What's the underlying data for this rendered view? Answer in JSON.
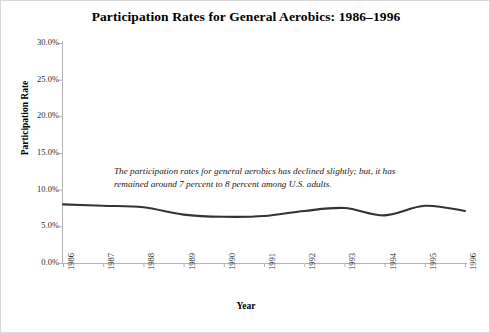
{
  "chart_data": {
    "type": "line",
    "title": "Participation Rates for General Aerobics: 1986–1996",
    "xlabel": "Year",
    "ylabel": "Participation Rate",
    "categories": [
      "1986",
      "1987",
      "1988",
      "1989",
      "1990",
      "1991",
      "1992",
      "1993",
      "1994",
      "1995",
      "1996"
    ],
    "x": [
      1986,
      1987,
      1988,
      1989,
      1990,
      1991,
      1992,
      1993,
      1994,
      1995,
      1996
    ],
    "values": [
      8.0,
      7.8,
      7.6,
      6.6,
      6.3,
      6.4,
      7.1,
      7.5,
      6.5,
      7.8,
      7.1
    ],
    "series": [
      {
        "name": "General Aerobics",
        "values": [
          8.0,
          7.8,
          7.6,
          6.6,
          6.3,
          6.4,
          7.1,
          7.5,
          6.5,
          7.8,
          7.1
        ]
      }
    ],
    "ylim": [
      0,
      30
    ],
    "ytick_values": [
      0.0,
      5.0,
      10.0,
      15.0,
      20.0,
      25.0,
      30.0
    ],
    "ytick_labels": [
      "0.0%",
      "5.0%",
      "10.0%",
      "15.0%",
      "20.0%",
      "25.0%",
      "30.0%"
    ],
    "xtick_labels": [
      "1986",
      "1987",
      "1988",
      "1989",
      "1990",
      "1991",
      "1992",
      "1993",
      "1994",
      "1995",
      "1996"
    ],
    "grid": false,
    "legend": "none",
    "line_color": "#333333",
    "annotations": [
      {
        "text": "The participation rates for general aerobics has declined slightly; but, it has remained around 7 percent to 8 percent among U.S. adults.",
        "style": "italic"
      }
    ]
  },
  "colors": {
    "line": "#333333",
    "axis": "#aaaaaa",
    "frame": "#d8d8d8",
    "background": "#ffffff",
    "text": "#1a1a1a"
  },
  "annotation_text": "The participation rates for general aerobics has declined slightly; but, it has remained around 7 percent to 8 percent among U.S. adults."
}
